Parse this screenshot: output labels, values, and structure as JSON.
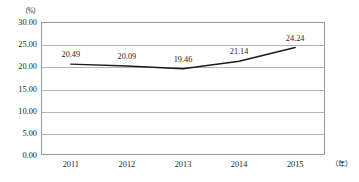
{
  "chart_data": {
    "type": "line",
    "title": "",
    "xlabel": "（年）",
    "ylabel": "（%）",
    "categories": [
      "2011",
      "2012",
      "2013",
      "2014",
      "2015"
    ],
    "values": [
      20.49,
      20.09,
      19.46,
      21.14,
      24.24
    ],
    "data_labels": [
      "20.49",
      "20.09",
      "19.46",
      "21.14",
      "24.24"
    ],
    "series": [
      {
        "name": "",
        "values": [
          20.49,
          20.09,
          19.46,
          21.14,
          24.24
        ],
        "color": "#1a1a1a"
      }
    ],
    "ylim": [
      0,
      30
    ],
    "ytick_step": 5,
    "ytick_labels": [
      "30.00",
      "25.00",
      "20.00",
      "15.00",
      "10.00",
      "5.00",
      "0.00"
    ],
    "ytick_values": [
      30,
      25,
      20,
      15,
      10,
      5,
      0
    ],
    "grid": true,
    "legend": "none",
    "line_style": "solid",
    "markers": "none",
    "axis_unit_top": "（%）",
    "axis_unit_right": "（年）",
    "colors": {
      "line": "#1a1a1a",
      "grid": "#b4b4b4",
      "frame": "#9a9a9a",
      "text": "#231f20",
      "background": "#ffffff"
    }
  }
}
